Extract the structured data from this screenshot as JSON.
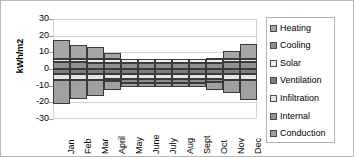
{
  "chart_data": {
    "type": "bar",
    "stacked": true,
    "title": "",
    "xlabel": "",
    "ylabel": "kWh/m2",
    "ylim": [
      -30,
      30
    ],
    "yticks": [
      30,
      20,
      10,
      0,
      -10,
      -20,
      -30
    ],
    "grid": true,
    "legend_position": "right",
    "categories": [
      "Jan",
      "Feb",
      "Mar",
      "April",
      "May",
      "June",
      "July",
      "Aug",
      "Sept",
      "Oct",
      "Nov",
      "Dec"
    ],
    "series": [
      {
        "name": "Heating",
        "values": [
          11.5,
          8.5,
          7.0,
          3.5,
          0.0,
          0.0,
          0.0,
          0.0,
          0.0,
          0.5,
          5.0,
          9.0
        ]
      },
      {
        "name": "Cooling",
        "values": [
          0.0,
          0.0,
          0.0,
          -1.0,
          -2.5,
          -2.5,
          -2.5,
          -2.5,
          -2.5,
          -1.5,
          0.0,
          0.0
        ]
      },
      {
        "name": "Solar",
        "values": [
          1.5,
          2.0,
          2.5,
          2.5,
          2.5,
          2.5,
          2.5,
          2.5,
          2.5,
          2.5,
          2.0,
          1.5
        ]
      },
      {
        "name": "Ventilation",
        "values": [
          -3.0,
          -3.0,
          -3.0,
          -3.0,
          -3.0,
          -3.0,
          -3.0,
          -3.0,
          -3.0,
          -3.0,
          -3.0,
          -3.0
        ]
      },
      {
        "name": "Infiltration",
        "values": [
          -3.5,
          -3.5,
          -3.5,
          -3.0,
          -3.0,
          -3.0,
          -3.0,
          -3.0,
          -3.0,
          -3.0,
          -3.5,
          -3.5
        ]
      },
      {
        "name": "Internal",
        "values": [
          4.5,
          4.0,
          3.5,
          3.5,
          3.5,
          3.5,
          3.5,
          3.5,
          3.5,
          3.5,
          4.0,
          4.5
        ]
      },
      {
        "name": "Conduction",
        "values": [
          -14.5,
          -11.5,
          -10.0,
          -5.5,
          -2.5,
          -2.5,
          -2.5,
          -2.5,
          -2.5,
          -5.0,
          -8.0,
          -12.0
        ]
      }
    ],
    "stack_order_positive": [
      "Internal",
      "Solar",
      "Heating"
    ],
    "stack_order_negative": [
      "Ventilation",
      "Infiltration",
      "Cooling",
      "Conduction"
    ],
    "colors": {
      "Heating": "#a6a6a6",
      "Cooling": "#8c8c8c",
      "Solar": "#ededed",
      "Ventilation": "#7d7d7d",
      "Infiltration": "#e4e4e4",
      "Internal": "#909090",
      "Conduction": "#a0a0a0"
    }
  }
}
